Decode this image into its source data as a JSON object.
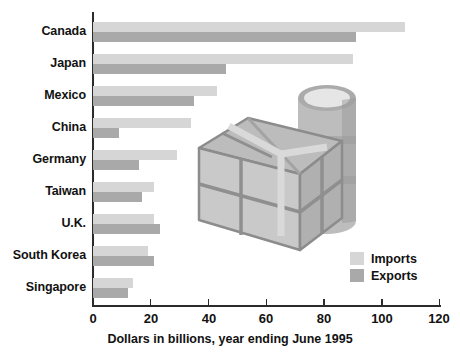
{
  "chart_data": {
    "type": "bar",
    "orientation": "horizontal",
    "title": "",
    "xlabel": "Dollars in billions, year ending June 1995",
    "ylabel": "",
    "xlim": [
      0,
      120
    ],
    "xticks": [
      0,
      20,
      40,
      60,
      80,
      100,
      120
    ],
    "grid": false,
    "legend_position": "inside-right",
    "categories": [
      "Canada",
      "Japan",
      "Mexico",
      "China",
      "Germany",
      "Taiwan",
      "U.K.",
      "South Korea",
      "Singapore"
    ],
    "series": [
      {
        "name": "Imports",
        "color": "#d6d6d6",
        "values": [
          108,
          90,
          43,
          34,
          29,
          21,
          21,
          19,
          14
        ]
      },
      {
        "name": "Exports",
        "color": "#a9a9a9",
        "values": [
          91,
          46,
          35,
          9,
          16,
          17,
          23,
          21,
          12
        ]
      }
    ]
  },
  "axis": {
    "tick_labels": [
      "0",
      "20",
      "40",
      "60",
      "80",
      "100",
      "120"
    ],
    "caption": "Dollars in billions, year ending June 1995"
  },
  "legend": {
    "items": [
      {
        "label": "Imports",
        "color": "#d6d6d6"
      },
      {
        "label": "Exports",
        "color": "#a9a9a9"
      }
    ]
  },
  "artwork": {
    "name": "crate-and-barrel-illustration",
    "elements": [
      "shipping-crate",
      "oil-drum"
    ]
  },
  "colors": {
    "imports": "#d6d6d6",
    "exports": "#a9a9a9",
    "axis": "#2b2b2b",
    "text": "#121212",
    "background": "#ffffff"
  }
}
